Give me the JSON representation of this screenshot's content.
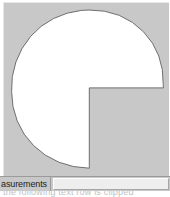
{
  "window": {
    "background_color": "#ffffff"
  },
  "canvas": {
    "name": "shape-viewport",
    "background_color": "#c8c8c8",
    "shape_fill_color": "#ffffff",
    "shape_stroke_color": "#6f6f6f",
    "shape_description": "three-quarter-disc"
  },
  "bottom_bar": {
    "label_text": "asurements",
    "field_value": "",
    "field_placeholder": ""
  },
  "footer": {
    "clipped_text": "the following text row is clipped"
  }
}
